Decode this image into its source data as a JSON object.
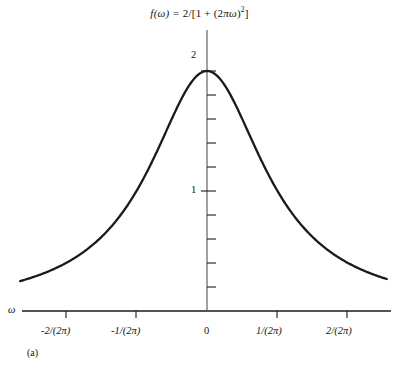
{
  "figure": {
    "title_plain": "f(ω) = 2/[1 + (2πω)²]",
    "caption": "(a)",
    "x_axis_name": "ω"
  },
  "axes": {
    "x_tick_labels": [
      "-2/(2π)",
      "-1/(2π)",
      "0",
      "1/(2π)",
      "2/(2π)"
    ],
    "y_tick_labels": [
      "1",
      "2"
    ]
  },
  "chart_data": {
    "type": "line",
    "subtitle": "(a)",
    "xlabel": "ω",
    "ylabel": "",
    "grid": false,
    "legend": null,
    "function": "f(ω) = 2/[1 + (2πω)²]",
    "xlim": [
      -2.65,
      2.55
    ],
    "ylim": [
      0,
      2.1
    ],
    "x_unit": "1/(2π)",
    "xticks": [
      -2,
      -1,
      0,
      1,
      2
    ],
    "xtick_labels": [
      "-2/(2π)",
      "-1/(2π)",
      "0",
      "1/(2π)",
      "2/(2π)"
    ],
    "yticks": [
      0.2,
      0.4,
      0.6,
      0.8,
      1.0,
      1.2,
      1.4,
      1.6,
      1.8,
      2.0
    ],
    "ytick_labels": [
      "",
      "",
      "",
      "",
      "1",
      "",
      "",
      "",
      "",
      "2"
    ],
    "ylabeled_ticks": [
      1,
      2
    ],
    "series": [
      {
        "name": "f(ω) = 2/[1 + (2πω)²]",
        "color": "#1a1a1a",
        "x": [
          -2.65,
          -2.4,
          -2.2,
          -2.0,
          -1.8,
          -1.6,
          -1.4,
          -1.2,
          -1.0,
          -0.9,
          -0.8,
          -0.7,
          -0.6,
          -0.5,
          -0.4,
          -0.3,
          -0.2,
          -0.1,
          0.0,
          0.1,
          0.2,
          0.3,
          0.4,
          0.5,
          0.6,
          0.7,
          0.8,
          0.9,
          1.0,
          1.2,
          1.4,
          1.6,
          1.8,
          2.0,
          2.2,
          2.4,
          2.55
        ],
        "y": [
          0.243,
          0.291,
          0.333,
          0.4,
          0.471,
          0.561,
          0.676,
          0.82,
          1.0,
          1.105,
          1.22,
          1.342,
          1.471,
          1.6,
          1.724,
          1.835,
          1.923,
          1.98,
          2.0,
          1.98,
          1.923,
          1.835,
          1.724,
          1.6,
          1.471,
          1.342,
          1.22,
          1.105,
          1.0,
          0.82,
          0.676,
          0.561,
          0.471,
          0.4,
          0.333,
          0.291,
          0.258
        ]
      }
    ],
    "peak": {
      "x": 0,
      "y": 2.0
    },
    "half_max_points": [
      {
        "x": -1,
        "y": 1.0
      },
      {
        "x": 1,
        "y": 1.0
      }
    ]
  }
}
